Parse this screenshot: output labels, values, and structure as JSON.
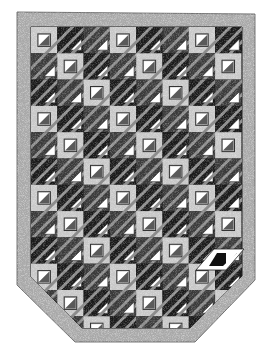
{
  "image": {
    "title": "Quilt illustration",
    "description": "Black-and-white speckled quilt with framed half-square-triangle blocks on a diagonal lattice, chamfered bottom corners and wide speckled border",
    "width": 271,
    "height": 361
  },
  "quilt": {
    "outline": [
      [
        17,
        12
      ],
      [
        255,
        14
      ],
      [
        255,
        280
      ],
      [
        195,
        342
      ],
      [
        75,
        342
      ],
      [
        17,
        285
      ]
    ],
    "inner_outline": [
      [
        31,
        27
      ],
      [
        242,
        27
      ],
      [
        242,
        276
      ],
      [
        190,
        328
      ],
      [
        82,
        328
      ],
      [
        31,
        277
      ]
    ],
    "cell_size": 26.3,
    "columns": 8,
    "rows": 12,
    "origin": [
      31,
      27
    ],
    "framed_block_rule": "(col - row) mod 3 == 0",
    "highlight_parallelogram": [
      [
        214,
        249
      ],
      [
        244,
        249
      ],
      [
        226,
        270
      ],
      [
        196,
        270
      ]
    ],
    "colors": {
      "background": "#ffffff",
      "border": "#a9a9a9",
      "frame": "#c8c8c8",
      "dark": "#1a1a1a",
      "mid": "#5a5a5a",
      "light_triangle": "#ffffff",
      "stripe": "#8c8c8c"
    }
  }
}
